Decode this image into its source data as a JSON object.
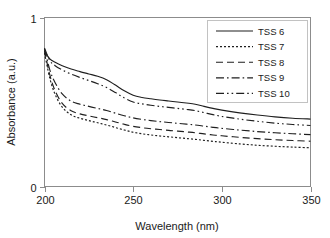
{
  "chart_data": {
    "type": "line",
    "title": "",
    "xlabel": "Wavelength (nm)",
    "ylabel": "Absorbance (a.u.)",
    "xlim": [
      200,
      350
    ],
    "ylim": [
      0,
      1
    ],
    "xticks": [
      200,
      250,
      300,
      350
    ],
    "xtick_labels": [
      "200",
      "250",
      "300",
      "350"
    ],
    "yticks": [
      0,
      1
    ],
    "ytick_labels": [
      "0",
      "1"
    ],
    "grid": false,
    "legend_position": "top-right",
    "x": [
      200,
      203,
      206,
      210,
      215,
      220,
      225,
      230,
      235,
      240,
      245,
      250,
      255,
      260,
      265,
      270,
      275,
      280,
      285,
      290,
      295,
      300,
      310,
      320,
      330,
      340,
      350
    ],
    "series": [
      {
        "name": "TSS 6",
        "linestyle": "solid",
        "color": "#1f1f1f",
        "values": [
          0.8,
          0.755,
          0.735,
          0.715,
          0.695,
          0.68,
          0.666,
          0.652,
          0.632,
          0.6,
          0.566,
          0.54,
          0.527,
          0.519,
          0.512,
          0.506,
          0.5,
          0.494,
          0.487,
          0.474,
          0.462,
          0.452,
          0.436,
          0.423,
          0.412,
          0.404,
          0.399
        ]
      },
      {
        "name": "TSS 7",
        "linestyle": "dotted",
        "color": "#1f1f1f",
        "values": [
          0.79,
          0.64,
          0.545,
          0.47,
          0.424,
          0.404,
          0.39,
          0.377,
          0.364,
          0.349,
          0.334,
          0.321,
          0.312,
          0.305,
          0.299,
          0.294,
          0.289,
          0.284,
          0.279,
          0.273,
          0.267,
          0.262,
          0.252,
          0.244,
          0.238,
          0.233,
          0.229
        ]
      },
      {
        "name": "TSS 8",
        "linestyle": "dashed",
        "color": "#1f1f1f",
        "values": [
          0.805,
          0.66,
          0.566,
          0.492,
          0.448,
          0.43,
          0.418,
          0.407,
          0.396,
          0.382,
          0.368,
          0.356,
          0.348,
          0.342,
          0.337,
          0.332,
          0.328,
          0.323,
          0.318,
          0.311,
          0.305,
          0.3,
          0.291,
          0.283,
          0.277,
          0.272,
          0.268
        ]
      },
      {
        "name": "TSS 9",
        "linestyle": "dashdot",
        "color": "#1f1f1f",
        "values": [
          0.815,
          0.69,
          0.614,
          0.548,
          0.505,
          0.487,
          0.474,
          0.462,
          0.45,
          0.434,
          0.419,
          0.406,
          0.397,
          0.39,
          0.384,
          0.379,
          0.374,
          0.369,
          0.364,
          0.357,
          0.35,
          0.344,
          0.334,
          0.325,
          0.318,
          0.312,
          0.307
        ]
      },
      {
        "name": "TSS 10",
        "linestyle": "dashdotdot",
        "color": "#1f1f1f",
        "values": [
          0.82,
          0.745,
          0.715,
          0.69,
          0.665,
          0.645,
          0.627,
          0.608,
          0.586,
          0.556,
          0.524,
          0.5,
          0.489,
          0.481,
          0.474,
          0.468,
          0.462,
          0.456,
          0.449,
          0.437,
          0.425,
          0.415,
          0.399,
          0.386,
          0.375,
          0.367,
          0.361
        ]
      }
    ]
  },
  "legend": {
    "items": [
      {
        "label": "TSS 6"
      },
      {
        "label": "TSS 7"
      },
      {
        "label": "TSS 8"
      },
      {
        "label": "TSS 9"
      },
      {
        "label": "TSS 10"
      }
    ]
  }
}
